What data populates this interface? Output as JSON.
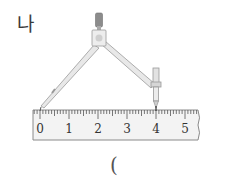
{
  "problem": {
    "label": "나",
    "answer_paren": "("
  },
  "ruler": {
    "unit": "cm",
    "tick_labels": [
      "0",
      "1",
      "2",
      "3",
      "4",
      "5"
    ],
    "compass_start": 0,
    "compass_end": 4
  },
  "colors": {
    "ruler_fill": "#f3f3f3",
    "ruler_stroke": "#8a8a8a",
    "compass_fill": "#e2e2e2",
    "compass_stroke": "#9a9a9a",
    "knob": "#8c8c8c"
  }
}
